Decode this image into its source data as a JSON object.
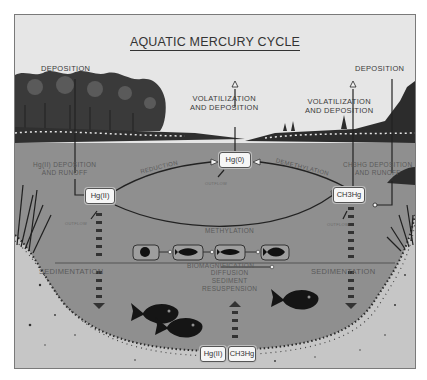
{
  "title": "AQUATIC MERCURY CYCLE",
  "labels": {
    "deposition_left": "DEPOSITION",
    "deposition_right": "DEPOSITION",
    "volatilization_center_1": "VOLATILIZATION",
    "volatilization_center_2": "AND DEPOSITION",
    "volatilization_right_1": "VOLATILIZATION",
    "volatilization_right_2": "AND DEPOSITION",
    "hg2_runoff_1": "Hg(II) DEPOSITION",
    "hg2_runoff_2": "AND RUNOFF",
    "ch3hg_runoff_1": "CH3HG DEPOSITION",
    "ch3hg_runoff_2": "AND RUNOFF",
    "reduction": "REDUCTION",
    "demethylation": "DEMETHYLATION",
    "methylation": "METHYLATION",
    "biomagnification": "BIOMAGNIFICATION",
    "sedimentation_left": "SEDIMENTATION",
    "sedimentation_right": "SEDIMENTATION",
    "diffusion_1": "DIFFUSION",
    "diffusion_2": "SEDIMENT",
    "diffusion_3": "RESUSPENSION",
    "outflow_left": "OUTFLOW",
    "outflow_center": "OUTFLOW",
    "outflow_right": "OUTFLOW"
  },
  "species": {
    "hg0": "Hg(0)",
    "hg2": "Hg(II)",
    "ch3hg": "CH3Hg",
    "sediment_hg2": "Hg(II)",
    "sediment_ch3hg": "CH3Hg"
  },
  "food_chain": [
    "plankton-icon",
    "small-fish-icon",
    "medium-fish-icon",
    "large-fish-icon"
  ],
  "colors": {
    "sky": "#e6e6e6",
    "water": "#8e8e8e",
    "sediment": "#c8c8c8",
    "ink": "#222222",
    "box": "#f6f6f6"
  }
}
